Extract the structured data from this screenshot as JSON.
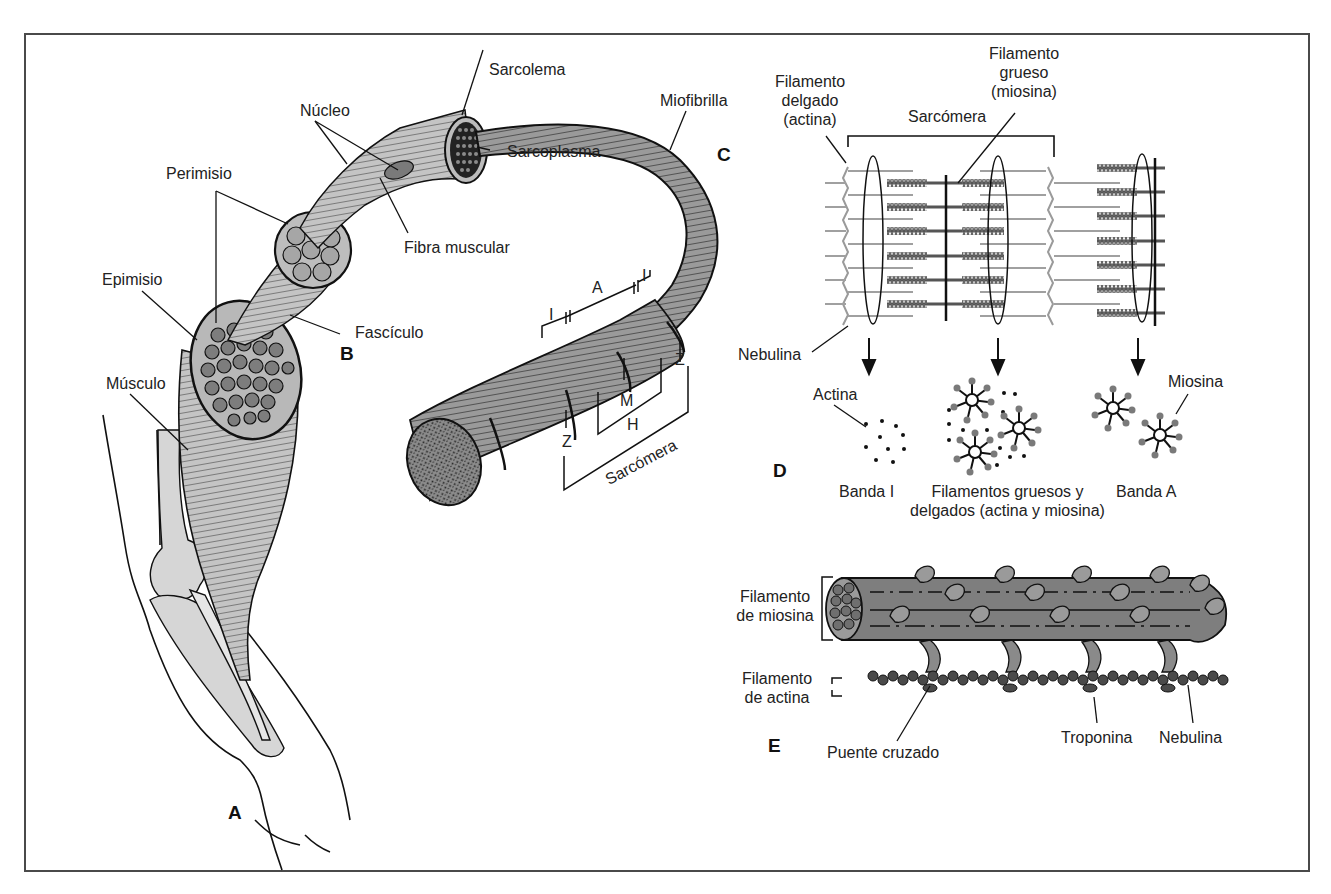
{
  "figure": {
    "colors": {
      "frame": "#4a4a4a",
      "tissue_light": "#c8c8c8",
      "tissue_mid": "#8a8a8a",
      "tissue_dark": "#3c3c3c",
      "line": "#111111",
      "actin_gray": "#9a9a9a",
      "head_gray": "#7a7a7a"
    }
  },
  "panels": {
    "A": "A",
    "B": "B",
    "C": "C",
    "D": "D",
    "E": "E"
  },
  "panel_a": {
    "labels": {
      "musculo": "Músculo",
      "epimisio": "Epimisio"
    }
  },
  "panel_b": {
    "labels": {
      "perimisio": "Perimisio",
      "fasciculo": "Fascículo",
      "nucleo": "Núcleo",
      "fibra_muscular": "Fibra muscular",
      "sarcolema": "Sarcolema",
      "sarcoplasma": "Sarcoplasma"
    }
  },
  "panel_c": {
    "labels": {
      "miofibrilla": "Miofibrilla",
      "band_a": "A",
      "band_i": "I",
      "band_i2": "I",
      "z_left": "Z",
      "z_right": "Z",
      "m_line": "M",
      "h_zone": "H",
      "sarcomera": "Sarcómera"
    }
  },
  "panel_d": {
    "labels": {
      "filamento_delgado": [
        "Filamento",
        "delgado",
        "(actina)"
      ],
      "filamento_grueso": [
        "Filamento",
        "grueso",
        "(miosina)"
      ],
      "sarcomera": "Sarcómera",
      "nebulina": "Nebulina",
      "actina": "Actina",
      "miosina": "Miosina",
      "banda_i": "Banda I",
      "filamentos_mixtos": [
        "Filamentos gruesos y",
        "delgados (actina y miosina)"
      ],
      "banda_a": "Banda A"
    }
  },
  "panel_e": {
    "labels": {
      "filamento_miosina": [
        "Filamento",
        "de miosina"
      ],
      "filamento_actina": [
        "Filamento",
        "de actina"
      ],
      "puente_cruzado": "Puente cruzado",
      "troponina": "Troponina",
      "nebulina": "Nebulina"
    }
  }
}
